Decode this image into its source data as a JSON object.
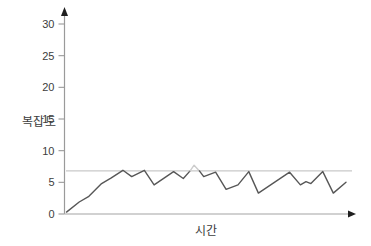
{
  "figure": {
    "background": "#ffffff"
  },
  "chart_data": {
    "type": "line",
    "title": "",
    "xlabel": "시간",
    "ylabel": "복잡도",
    "xlim": [
      0,
      100
    ],
    "ylim": [
      0,
      30
    ],
    "yticks": [
      0,
      5,
      10,
      15,
      20,
      25,
      30
    ],
    "xticks": [],
    "grid": false,
    "legend": "none",
    "axis_color": "#9a9a9a",
    "x_axis_color": "#c2c2c2",
    "arrow_color": "#1f1f1f",
    "tick_label_color": "#3d3d3d",
    "line_color": "#575757",
    "highlight_color": "#cccccc",
    "threshold_line": {
      "value": 6.8,
      "color": "#c9c9c9"
    },
    "series": [
      {
        "name": "복잡도",
        "segments": [
          {
            "style": "normal",
            "points": [
              [
                0.7,
                0.3
              ],
              [
                5.2,
                1.9
              ],
              [
                8.6,
                2.8
              ],
              [
                13.1,
                4.8
              ],
              [
                16.5,
                5.7
              ],
              [
                20.6,
                6.9
              ],
              [
                23.7,
                5.9
              ],
              [
                28.2,
                6.9
              ],
              [
                31.6,
                4.6
              ],
              [
                38.5,
                6.7
              ],
              [
                41.9,
                5.6
              ],
              [
                44.3,
                6.8
              ]
            ]
          },
          {
            "style": "above-threshold",
            "points": [
              [
                44.3,
                6.8
              ],
              [
                45.7,
                7.7
              ],
              [
                47.6,
                6.8
              ]
            ]
          },
          {
            "style": "normal",
            "points": [
              [
                47.6,
                6.8
              ],
              [
                49.1,
                5.9
              ],
              [
                53.3,
                6.6
              ],
              [
                57.0,
                3.9
              ],
              [
                61.2,
                4.6
              ],
              [
                65.0,
                6.7
              ],
              [
                68.4,
                3.3
              ],
              [
                79.4,
                6.6
              ],
              [
                83.2,
                4.6
              ],
              [
                85.2,
                5.1
              ],
              [
                86.9,
                4.8
              ],
              [
                91.1,
                6.7
              ],
              [
                94.8,
                3.3
              ],
              [
                99.3,
                5.0
              ]
            ]
          }
        ]
      }
    ]
  }
}
